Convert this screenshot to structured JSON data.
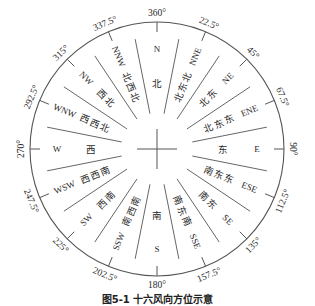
{
  "diagram": {
    "type": "compass-rose",
    "center": {
      "x": 157,
      "y": 149
    },
    "outer_radius": 127,
    "stroke_color": "#555555",
    "text_color": "#2a2a2a",
    "directions": [
      {
        "angle": 0,
        "degree_label": "360°",
        "abbr": "N",
        "chinese": "北"
      },
      {
        "angle": 22.5,
        "degree_label": "22.5°",
        "abbr": "NNE",
        "chinese": "北东北"
      },
      {
        "angle": 45,
        "degree_label": "45°",
        "abbr": "NE",
        "chinese": "东北"
      },
      {
        "angle": 67.5,
        "degree_label": "67.5°",
        "abbr": "ENE",
        "chinese": "东东北"
      },
      {
        "angle": 90,
        "degree_label": "90°",
        "abbr": "E",
        "chinese": "东"
      },
      {
        "angle": 112.5,
        "degree_label": "112.5°",
        "abbr": "ESE",
        "chinese": "东东南"
      },
      {
        "angle": 135,
        "degree_label": "135°",
        "abbr": "SE",
        "chinese": "东南"
      },
      {
        "angle": 157.5,
        "degree_label": "157.5°",
        "abbr": "SSE",
        "chinese": "南东南"
      },
      {
        "angle": 180,
        "degree_label": "180°",
        "abbr": "S",
        "chinese": "南"
      },
      {
        "angle": 202.5,
        "degree_label": "202.5°",
        "abbr": "SSW",
        "chinese": "南西南"
      },
      {
        "angle": 225,
        "degree_label": "225°",
        "abbr": "SW",
        "chinese": "西南"
      },
      {
        "angle": 247.5,
        "degree_label": "247.5°",
        "abbr": "WSW",
        "chinese": "西西南"
      },
      {
        "angle": 270,
        "degree_label": "270°",
        "abbr": "W",
        "chinese": "西"
      },
      {
        "angle": 292.5,
        "degree_label": "292.5°",
        "abbr": "WNW",
        "chinese": "西西北"
      },
      {
        "angle": 315,
        "degree_label": "315°",
        "abbr": "NW",
        "chinese": "西北"
      },
      {
        "angle": 337.5,
        "degree_label": "337.5°",
        "abbr": "NNW",
        "chinese": "北西北"
      }
    ]
  },
  "caption": "图5-1  十六风向方位示意"
}
